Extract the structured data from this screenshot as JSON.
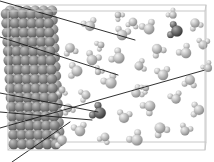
{
  "figure": {
    "kind": "molecular-dynamics-snapshot",
    "title": "",
    "caption": "",
    "background_color": "#ffffff",
    "width": 214,
    "height": 162
  },
  "simulation_box": {
    "label": "simulation-box",
    "edge_color": "#c8c8c8",
    "edge_width": 1,
    "front_face": {
      "x": 8,
      "y": 11,
      "w": 197,
      "h": 139
    },
    "back_face": {
      "x": 16,
      "y": 5,
      "w": 190,
      "h": 137
    },
    "perspective_connectors": [
      {
        "from": [
          8,
          11
        ],
        "to": [
          16,
          5
        ]
      },
      {
        "from": [
          205,
          11
        ],
        "to": [
          206,
          5
        ]
      },
      {
        "from": [
          8,
          150
        ],
        "to": [
          16,
          142
        ]
      },
      {
        "from": [
          205,
          150
        ],
        "to": [
          206,
          142
        ]
      }
    ]
  },
  "solid_slab": {
    "label": "crystalline-substrate",
    "description": "ordered lattice of substrate atoms forming the solid surface on the left",
    "atom_color_light": "#b4b4b4",
    "atom_color_mid": "#8c8c8c",
    "atom_color_dark": "#5a5a5a",
    "atom_radius": 5.2,
    "columns": 6,
    "rows": 15,
    "x_origin": 6,
    "y_origin": 14,
    "x_spacing": 8.4,
    "y_spacing": 9.3,
    "row_shear_x": 0.55,
    "depth_layers": 2,
    "depth_offset": [
      4,
      -3.2
    ]
  },
  "fluid": {
    "label": "water-molecules",
    "description": "triatomic water molecules (one oxygen, two hydrogens) filling the region to the right of the solid",
    "oxygen": {
      "name": "oxygen-atom",
      "radius": 5.0,
      "color": "#bdbdbd",
      "highlight_color": "#efefef",
      "shadow_color": "#8e8e8e"
    },
    "hydrogen": {
      "name": "hydrogen-atom",
      "radius": 3.0,
      "color": "#cdcdcd",
      "highlight_color": "#f2f2f2",
      "shadow_color": "#9c9c9c"
    },
    "dark_oxygen": {
      "name": "highlighted-oxygen-atom",
      "color": "#6e6e6e",
      "highlight_color": "#a8a8a8",
      "shadow_color": "#3c3c3c"
    },
    "dark_hydrogen": {
      "name": "highlighted-hydrogen-atom",
      "color": "#7c7c7c",
      "highlight_color": "#b2b2b2",
      "shadow_color": "#454545"
    },
    "molecules": [
      {
        "x": 149,
        "y": 29,
        "r": 5.4,
        "a": 200,
        "b": 290,
        "dark": false
      },
      {
        "x": 177,
        "y": 31,
        "r": 5.6,
        "a": 150,
        "b": 240,
        "dark": true
      },
      {
        "x": 195,
        "y": 23,
        "r": 4.6,
        "a": 20,
        "b": 110,
        "dark": false
      },
      {
        "x": 122,
        "y": 35,
        "r": 5.2,
        "a": 240,
        "b": 330,
        "dark": false
      },
      {
        "x": 133,
        "y": 22,
        "r": 4.2,
        "a": 60,
        "b": 150,
        "dark": false
      },
      {
        "x": 90,
        "y": 26,
        "r": 5.0,
        "a": 200,
        "b": 300,
        "dark": false
      },
      {
        "x": 101,
        "y": 45,
        "r": 3.3,
        "a": 110,
        "b": 200,
        "dark": false
      },
      {
        "x": 157,
        "y": 49,
        "r": 5.0,
        "a": 10,
        "b": 100,
        "dark": false
      },
      {
        "x": 186,
        "y": 53,
        "r": 5.2,
        "a": 185,
        "b": 275,
        "dark": false
      },
      {
        "x": 203,
        "y": 45,
        "r": 4.4,
        "a": 230,
        "b": 320,
        "dark": false
      },
      {
        "x": 119,
        "y": 58,
        "r": 5.5,
        "a": 170,
        "b": 260,
        "dark": false
      },
      {
        "x": 139,
        "y": 66,
        "r": 4.4,
        "a": 300,
        "b": 30,
        "dark": false
      },
      {
        "x": 92,
        "y": 60,
        "r": 5.3,
        "a": 250,
        "b": 340,
        "dark": false
      },
      {
        "x": 70,
        "y": 48,
        "r": 4.8,
        "a": 30,
        "b": 120,
        "dark": false
      },
      {
        "x": 77,
        "y": 71,
        "r": 5.4,
        "a": 140,
        "b": 230,
        "dark": false
      },
      {
        "x": 163,
        "y": 75,
        "r": 5.2,
        "a": 215,
        "b": 305,
        "dark": false
      },
      {
        "x": 190,
        "y": 80,
        "r": 4.9,
        "a": 55,
        "b": 145,
        "dark": false
      },
      {
        "x": 111,
        "y": 83,
        "r": 5.6,
        "a": 195,
        "b": 285,
        "dark": false
      },
      {
        "x": 136,
        "y": 93,
        "r": 4.6,
        "a": 285,
        "b": 15,
        "dark": false
      },
      {
        "x": 86,
        "y": 95,
        "r": 4.4,
        "a": 120,
        "b": 210,
        "dark": false
      },
      {
        "x": 100,
        "y": 113,
        "r": 5.8,
        "a": 165,
        "b": 255,
        "dark": true
      },
      {
        "x": 68,
        "y": 108,
        "r": 4.2,
        "a": 25,
        "b": 115,
        "dark": false
      },
      {
        "x": 124,
        "y": 118,
        "r": 5.0,
        "a": 235,
        "b": 325,
        "dark": false
      },
      {
        "x": 150,
        "y": 106,
        "r": 5.3,
        "a": 95,
        "b": 185,
        "dark": false
      },
      {
        "x": 176,
        "y": 99,
        "r": 4.7,
        "a": 205,
        "b": 295,
        "dark": false
      },
      {
        "x": 199,
        "y": 110,
        "r": 5.1,
        "a": 140,
        "b": 230,
        "dark": false
      },
      {
        "x": 160,
        "y": 128,
        "r": 5.4,
        "a": 15,
        "b": 105,
        "dark": false
      },
      {
        "x": 185,
        "y": 131,
        "r": 4.5,
        "a": 250,
        "b": 340,
        "dark": false
      },
      {
        "x": 137,
        "y": 140,
        "r": 5.6,
        "a": 185,
        "b": 275,
        "dark": false
      },
      {
        "x": 105,
        "y": 137,
        "r": 4.3,
        "a": 70,
        "b": 160,
        "dark": false
      },
      {
        "x": 80,
        "y": 131,
        "r": 5.2,
        "a": 210,
        "b": 300,
        "dark": false
      },
      {
        "x": 62,
        "y": 140,
        "r": 4.8,
        "a": 130,
        "b": 220,
        "dark": false
      },
      {
        "x": 118,
        "y": 15,
        "r": 3.2,
        "a": 0,
        "b": 90,
        "dark": false
      },
      {
        "x": 173,
        "y": 15,
        "r": 3.6,
        "a": 180,
        "b": 270,
        "dark": false
      },
      {
        "x": 62,
        "y": 90,
        "r": 3.4,
        "a": 45,
        "b": 135,
        "dark": false
      },
      {
        "x": 98,
        "y": 72,
        "r": 3.0,
        "a": 260,
        "b": 350,
        "dark": false
      },
      {
        "x": 146,
        "y": 88,
        "r": 3.1,
        "a": 100,
        "b": 190,
        "dark": false
      },
      {
        "x": 208,
        "y": 68,
        "r": 4.0,
        "a": 190,
        "b": 280,
        "dark": false
      }
    ]
  },
  "annotation_lines": {
    "label": "annotation-pointer-lines",
    "color": "#1a1a1a",
    "width": 0.9,
    "lines": [
      {
        "name": "pointer-line-1",
        "from": [
          0,
          1
        ],
        "to": [
          135,
          40
        ]
      },
      {
        "name": "pointer-line-2",
        "from": [
          0,
          37
        ],
        "to": [
          118,
          75
        ]
      },
      {
        "name": "pointer-line-3",
        "from": [
          0,
          93
        ],
        "to": [
          98,
          112
        ]
      },
      {
        "name": "pointer-line-4",
        "from": [
          0,
          112
        ],
        "to": [
          92,
          120
        ]
      },
      {
        "name": "pointer-line-5",
        "from": [
          0,
          128
        ],
        "to": [
          205,
          70
        ]
      },
      {
        "name": "pointer-line-6",
        "from": [
          12,
          162
        ],
        "to": [
          70,
          122
        ]
      }
    ]
  }
}
